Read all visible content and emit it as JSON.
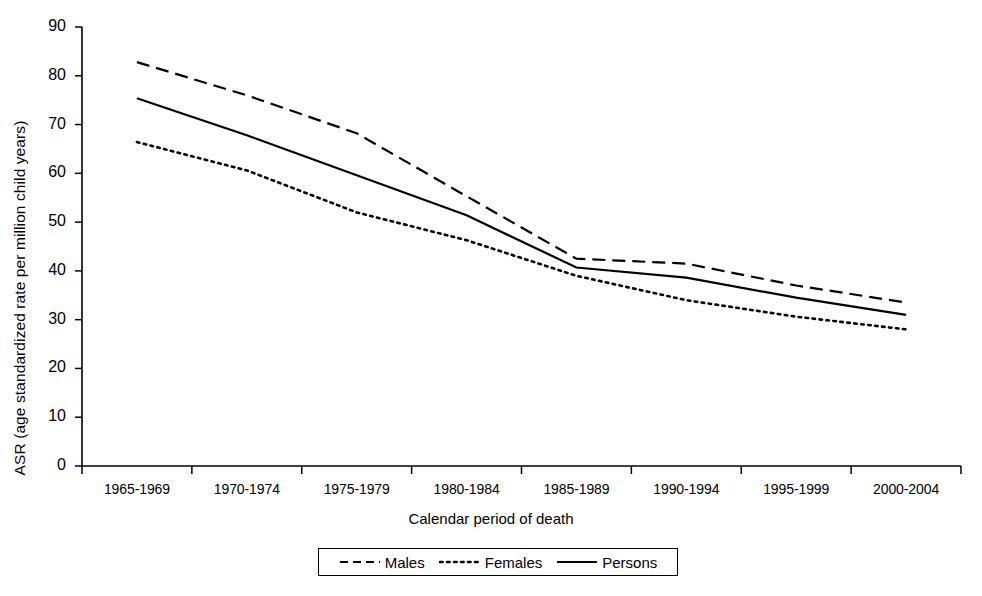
{
  "chart_data": {
    "type": "line",
    "title": "",
    "xlabel": "Calendar period of death",
    "ylabel": "ASR (age standardized rate per million child years)",
    "categories": [
      "1965-1969",
      "1970-1974",
      "1975-1979",
      "1980-1984",
      "1985-1989",
      "1990-1994",
      "1995-1999",
      "2000-2004"
    ],
    "yticks": [
      0,
      10,
      20,
      30,
      40,
      50,
      60,
      70,
      80,
      90
    ],
    "ylim": [
      0,
      90
    ],
    "grid": false,
    "legend_position": "bottom",
    "series": [
      {
        "name": "Males",
        "style": "dashed",
        "values": [
          82.8,
          76.0,
          68.2,
          55.3,
          42.5,
          41.5,
          37.0,
          33.5
        ]
      },
      {
        "name": "Females",
        "style": "dotted",
        "values": [
          66.4,
          60.6,
          52.0,
          46.3,
          39.0,
          34.0,
          30.6,
          28.0
        ]
      },
      {
        "name": "Persons",
        "style": "solid",
        "values": [
          75.4,
          67.8,
          59.6,
          51.4,
          40.7,
          38.6,
          34.5,
          31.0
        ]
      }
    ]
  },
  "legend": {
    "entries": [
      {
        "label": "Males",
        "style": "dashed"
      },
      {
        "label": "Females",
        "style": "dotted"
      },
      {
        "label": "Persons",
        "style": "solid"
      }
    ]
  }
}
